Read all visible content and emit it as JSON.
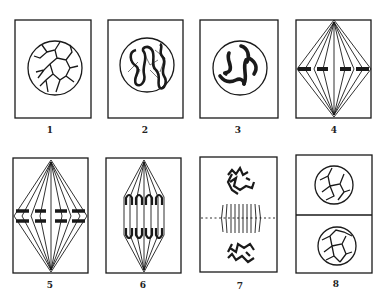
{
  "figure": {
    "stroke_color": "#1a1a1a",
    "background": "#ffffff",
    "panels": [
      {
        "id": 1,
        "label": "1",
        "stage": "resting nucleus with chromatin network"
      },
      {
        "id": 2,
        "label": "2",
        "stage": "prophase - coiled spireme threads"
      },
      {
        "id": 3,
        "label": "3",
        "stage": "late prophase - condensed chromosomes"
      },
      {
        "id": 4,
        "label": "4",
        "stage": "metaphase - chromosomes on spindle equator"
      },
      {
        "id": 5,
        "label": "5",
        "stage": "metaphase - split chromosomes"
      },
      {
        "id": 6,
        "label": "6",
        "stage": "anaphase - chromosomes moving to poles"
      },
      {
        "id": 7,
        "label": "7",
        "stage": "telophase - daughter nuclei forming"
      },
      {
        "id": 8,
        "label": "8",
        "stage": "two daughter cells with resting nuclei"
      }
    ]
  }
}
